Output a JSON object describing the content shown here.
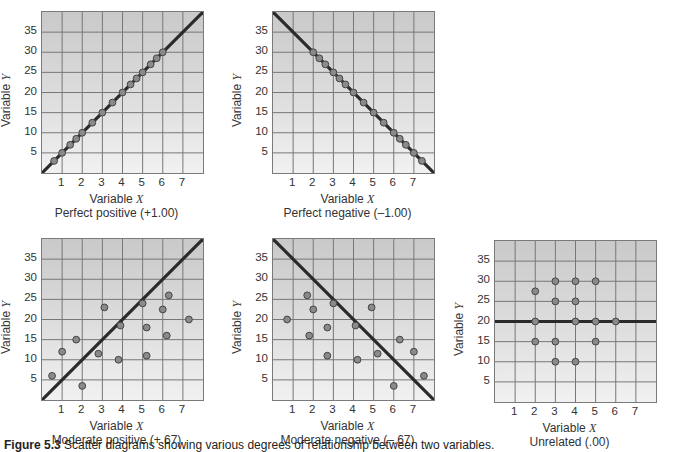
{
  "figure": {
    "caption_label": "Figure 5.3",
    "caption_text": "Scatter diagrams showing various degrees of relationship between two variables."
  },
  "axis": {
    "x_ticks": [
      "1",
      "2",
      "3",
      "4",
      "5",
      "6",
      "7"
    ],
    "y_ticks": [
      "35",
      "30",
      "25",
      "20",
      "15",
      "10",
      "5"
    ],
    "x_label_prefix": "Variable ",
    "x_label_var": "X",
    "y_label_prefix": "Variable ",
    "y_label_var": "Y"
  },
  "panels": [
    {
      "subtitle": "Perfect positive (+1.00)"
    },
    {
      "subtitle": "Perfect negative (–1.00)"
    },
    {
      "subtitle": "Moderate positive (+.67)"
    },
    {
      "subtitle": "Moderate negative (–.67)"
    },
    {
      "subtitle": "Unrelated (.00)"
    }
  ],
  "colors": {
    "line": "#2a2a2a",
    "grid": "#777777",
    "point_fill": "#8a8a8a",
    "point_stroke": "#444444"
  },
  "chart_data": [
    {
      "type": "scatter",
      "title": "Perfect positive (+1.00)",
      "xlabel": "Variable X",
      "ylabel": "Variable Y",
      "xlim": [
        0,
        8
      ],
      "ylim": [
        0,
        40
      ],
      "x_ticks": [
        1,
        2,
        3,
        4,
        5,
        6,
        7
      ],
      "y_ticks": [
        5,
        10,
        15,
        20,
        25,
        30,
        35
      ],
      "grid": true,
      "points": [
        [
          0.6,
          3
        ],
        [
          1,
          5
        ],
        [
          1.4,
          7
        ],
        [
          1.7,
          8.5
        ],
        [
          2,
          10
        ],
        [
          2.5,
          12.5
        ],
        [
          3,
          15
        ],
        [
          3.5,
          17.5
        ],
        [
          4,
          20
        ],
        [
          4.4,
          22
        ],
        [
          4.7,
          23.5
        ],
        [
          5,
          25
        ],
        [
          5.4,
          27
        ],
        [
          5.7,
          28.5
        ],
        [
          6,
          30
        ]
      ],
      "line": {
        "from": [
          0,
          0
        ],
        "to": [
          8,
          40
        ]
      },
      "correlation": 1.0
    },
    {
      "type": "scatter",
      "title": "Perfect negative (–1.00)",
      "xlabel": "Variable X",
      "ylabel": "Variable Y",
      "xlim": [
        0,
        8
      ],
      "ylim": [
        0,
        40
      ],
      "x_ticks": [
        1,
        2,
        3,
        4,
        5,
        6,
        7
      ],
      "y_ticks": [
        5,
        10,
        15,
        20,
        25,
        30,
        35
      ],
      "grid": true,
      "points": [
        [
          2,
          30
        ],
        [
          2.3,
          28.5
        ],
        [
          2.6,
          27
        ],
        [
          3,
          25
        ],
        [
          3.3,
          23.5
        ],
        [
          3.6,
          22
        ],
        [
          4,
          20
        ],
        [
          4.5,
          17.5
        ],
        [
          5,
          15
        ],
        [
          5.5,
          12.5
        ],
        [
          6,
          10
        ],
        [
          6.3,
          8.5
        ],
        [
          6.6,
          7
        ],
        [
          7,
          5
        ],
        [
          7.4,
          3
        ]
      ],
      "line": {
        "from": [
          0,
          40
        ],
        "to": [
          8,
          0
        ]
      },
      "correlation": -1.0
    },
    {
      "type": "scatter",
      "title": "Moderate positive (+.67)",
      "xlabel": "Variable X",
      "ylabel": "Variable Y",
      "xlim": [
        0,
        8
      ],
      "ylim": [
        0,
        40
      ],
      "x_ticks": [
        1,
        2,
        3,
        4,
        5,
        6,
        7
      ],
      "y_ticks": [
        5,
        10,
        15,
        20,
        25,
        30,
        35
      ],
      "grid": true,
      "points": [
        [
          0.5,
          6
        ],
        [
          1,
          12
        ],
        [
          1.7,
          15
        ],
        [
          2,
          3.5
        ],
        [
          2.8,
          11.5
        ],
        [
          3.1,
          23
        ],
        [
          3.8,
          10
        ],
        [
          3.9,
          18.5
        ],
        [
          5,
          24
        ],
        [
          5.2,
          11
        ],
        [
          5.2,
          18
        ],
        [
          6,
          22.5
        ],
        [
          6.2,
          16
        ],
        [
          6.3,
          26
        ],
        [
          7.3,
          20
        ]
      ],
      "line": {
        "from": [
          0,
          0
        ],
        "to": [
          8,
          40
        ]
      },
      "correlation": 0.67
    },
    {
      "type": "scatter",
      "title": "Moderate negative (–.67)",
      "xlabel": "Variable X",
      "ylabel": "Variable Y",
      "xlim": [
        0,
        8
      ],
      "ylim": [
        0,
        40
      ],
      "x_ticks": [
        1,
        2,
        3,
        4,
        5,
        6,
        7
      ],
      "y_ticks": [
        5,
        10,
        15,
        20,
        25,
        30,
        35
      ],
      "grid": true,
      "points": [
        [
          0.7,
          20
        ],
        [
          1.7,
          26
        ],
        [
          1.8,
          16
        ],
        [
          2,
          22.5
        ],
        [
          2.7,
          18
        ],
        [
          2.7,
          11
        ],
        [
          3,
          24
        ],
        [
          4.1,
          18.5
        ],
        [
          4.2,
          10
        ],
        [
          4.9,
          23
        ],
        [
          5.2,
          11.5
        ],
        [
          6,
          3.5
        ],
        [
          6.3,
          15
        ],
        [
          7,
          12
        ],
        [
          7.5,
          6
        ]
      ],
      "line": {
        "from": [
          0,
          40
        ],
        "to": [
          8,
          0
        ]
      },
      "correlation": -0.67
    },
    {
      "type": "scatter",
      "title": "Unrelated (.00)",
      "xlabel": "Variable X",
      "ylabel": "Variable Y",
      "xlim": [
        0,
        8
      ],
      "ylim": [
        0,
        40
      ],
      "x_ticks": [
        1,
        2,
        3,
        4,
        5,
        6,
        7
      ],
      "y_ticks": [
        5,
        10,
        15,
        20,
        25,
        30,
        35
      ],
      "grid": true,
      "points": [
        [
          2,
          27.5
        ],
        [
          2,
          20
        ],
        [
          2,
          15
        ],
        [
          3,
          30
        ],
        [
          3,
          25
        ],
        [
          3,
          15
        ],
        [
          3,
          10
        ],
        [
          4,
          30
        ],
        [
          4,
          25
        ],
        [
          4,
          20
        ],
        [
          4,
          10
        ],
        [
          5,
          30
        ],
        [
          5,
          20
        ],
        [
          5,
          15
        ],
        [
          6,
          20
        ]
      ],
      "line": {
        "from": [
          0,
          20
        ],
        "to": [
          8,
          20
        ]
      },
      "correlation": 0.0
    }
  ]
}
